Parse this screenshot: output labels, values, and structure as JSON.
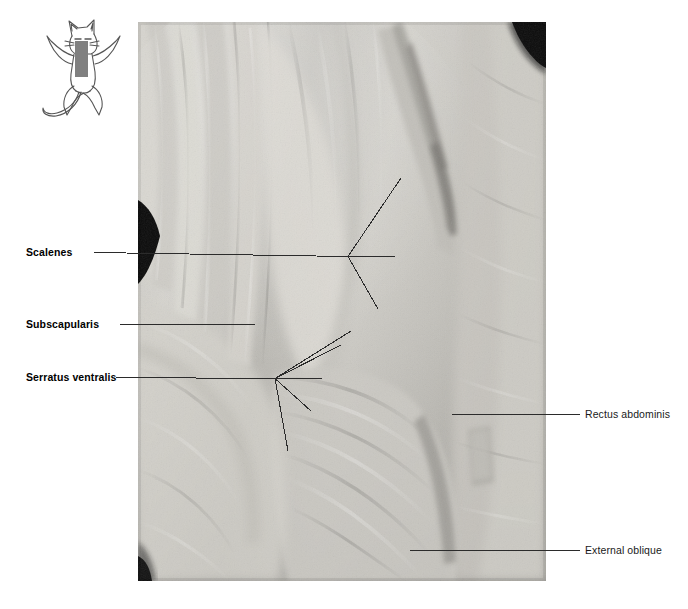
{
  "plate": {
    "width": 688,
    "height": 609,
    "background": "#ffffff"
  },
  "key_icon": {
    "name": "cat-body-diagram",
    "description": "line drawing of a cat standing upright with forelimbs spread",
    "highlight_color": "#808080",
    "outline_color": "#4d4d4d"
  },
  "photo": {
    "name": "cadaver-dissection-photograph",
    "type": "grayscale-anatomical-photograph",
    "left": 138,
    "top": 22,
    "width": 408,
    "height": 559,
    "tone_light": "#d8d6d0",
    "tone_mid": "#b2b0aa",
    "tone_dark": "#7d7b76",
    "tone_black": "#0a0a0a"
  },
  "labels": {
    "left": [
      {
        "id": "scalenes",
        "text": "Scalenes"
      },
      {
        "id": "subscapularis",
        "text": "Subscapularis"
      },
      {
        "id": "serratus",
        "text": "Serratus ventralis"
      }
    ],
    "right": [
      {
        "id": "rectus",
        "text": "Rectus abdominis"
      },
      {
        "id": "external",
        "text": "External oblique"
      }
    ]
  },
  "leader_lines": {
    "color": "#2b2b2b",
    "width": 1,
    "scalenes": {
      "stem": [
        94,
        252,
        348,
        256
      ],
      "branches": [
        [
          348,
          256,
          395,
          256
        ],
        [
          348,
          256,
          401,
          178
        ],
        [
          348,
          256,
          378,
          309
        ]
      ]
    },
    "subscapularis": {
      "stem": [
        120,
        324,
        255,
        324
      ]
    },
    "serratus": {
      "stem": [
        116,
        377,
        275,
        378
      ],
      "rays": [
        [
          275,
          378,
          351,
          331
        ],
        [
          275,
          378,
          341,
          345
        ],
        [
          275,
          378,
          322,
          378
        ],
        [
          275,
          378,
          311,
          411
        ],
        [
          275,
          378,
          288,
          451
        ]
      ]
    },
    "rectus": {
      "stem": [
        452,
        414,
        580,
        414
      ]
    },
    "external": {
      "stem": [
        410,
        550,
        580,
        550
      ]
    }
  }
}
